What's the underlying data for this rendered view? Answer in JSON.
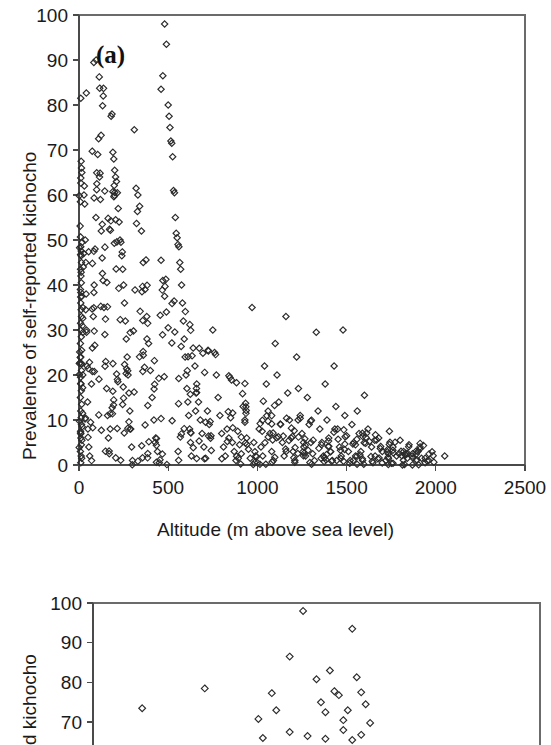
{
  "figure": {
    "caption_tags": [
      "(a)",
      "(b)"
    ],
    "marker_style": "open-diamond",
    "marker_color": "#2b2b2b",
    "axis_color": "#4a4a4a",
    "background": "#ffffff"
  },
  "panel_a": {
    "tag": "(a)",
    "xlabel": "Altitude (m above sea level)",
    "ylabel": "Prevalence of self-reported kichocho",
    "xticks": [
      "0",
      "500",
      "1000",
      "1500",
      "2000",
      "2500"
    ],
    "yticks": [
      "0",
      "10",
      "20",
      "30",
      "40",
      "50",
      "60",
      "70",
      "80",
      "90",
      "100"
    ]
  },
  "panel_b": {
    "tag": "(b)",
    "ylabel": "d kichocho",
    "yticks": [
      "70",
      "80",
      "90",
      "100"
    ]
  },
  "chart_data": [
    {
      "type": "scatter",
      "title": "(a)",
      "xlabel": "Altitude (m above sea level)",
      "ylabel": "Prevalence of self-reported kichocho",
      "xlim": [
        0,
        2500
      ],
      "ylim": [
        0,
        100
      ],
      "xticks": [
        0,
        500,
        1000,
        1500,
        2000,
        2500
      ],
      "yticks": [
        0,
        10,
        20,
        30,
        40,
        50,
        60,
        70,
        80,
        90,
        100
      ],
      "grid": false,
      "legend": "none",
      "marker": "open diamond",
      "n_points": 640,
      "description": "Strongly decreasing, wedge-shaped envelope: at low altitude (0-600 m) prevalence spans the full 0-100% range; above ~1600 m nearly all points fall below 15%, and beyond ~2050 m there is no data.",
      "points": [
        [
          10,
          81.5
        ],
        [
          12,
          67.5
        ],
        [
          14,
          66.0
        ],
        [
          16,
          65.0
        ],
        [
          8,
          58.5
        ],
        [
          18,
          49.5
        ],
        [
          10,
          48.5
        ],
        [
          12,
          46.5
        ],
        [
          14,
          45.0
        ],
        [
          9,
          43.5
        ],
        [
          11,
          42.0
        ],
        [
          13,
          40.5
        ],
        [
          8,
          39.0
        ],
        [
          15,
          37.5
        ],
        [
          10,
          36.0
        ],
        [
          12,
          34.5
        ],
        [
          14,
          33.0
        ],
        [
          9,
          31.5
        ],
        [
          11,
          30.0
        ],
        [
          13,
          28.5
        ],
        [
          8,
          27.0
        ],
        [
          15,
          25.5
        ],
        [
          10,
          24.0
        ],
        [
          12,
          22.5
        ],
        [
          14,
          21.0
        ],
        [
          9,
          19.5
        ],
        [
          11,
          18.0
        ],
        [
          13,
          16.5
        ],
        [
          8,
          15.0
        ],
        [
          15,
          13.5
        ],
        [
          10,
          12.0
        ],
        [
          12,
          10.5
        ],
        [
          14,
          9.0
        ],
        [
          9,
          7.5
        ],
        [
          11,
          6.0
        ],
        [
          13,
          4.5
        ],
        [
          8,
          3.0
        ],
        [
          15,
          1.5
        ],
        [
          10,
          0.5
        ],
        [
          12,
          2.0
        ],
        [
          16,
          5.5
        ],
        [
          18,
          8.5
        ],
        [
          20,
          11.5
        ],
        [
          22,
          35.0
        ],
        [
          24,
          44.0
        ],
        [
          26,
          47.0
        ],
        [
          28,
          60.0
        ],
        [
          30,
          62.0
        ],
        [
          32,
          58.0
        ],
        [
          35,
          50.0
        ],
        [
          38,
          45.0
        ],
        [
          40,
          38.0
        ],
        [
          42,
          30.0
        ],
        [
          45,
          22.0
        ],
        [
          48,
          14.0
        ],
        [
          50,
          8.0
        ],
        [
          55,
          4.0
        ],
        [
          60,
          2.0
        ],
        [
          65,
          9.5
        ],
        [
          70,
          18.0
        ],
        [
          75,
          26.0
        ],
        [
          80,
          33.0
        ],
        [
          85,
          40.0
        ],
        [
          90,
          48.0
        ],
        [
          95,
          55.0
        ],
        [
          100,
          62.5
        ],
        [
          105,
          69.0
        ],
        [
          110,
          72.5
        ],
        [
          115,
          64.0
        ],
        [
          120,
          59.0
        ],
        [
          125,
          52.0
        ],
        [
          130,
          46.0
        ],
        [
          135,
          41.0
        ],
        [
          140,
          35.0
        ],
        [
          145,
          29.0
        ],
        [
          150,
          23.0
        ],
        [
          155,
          17.0
        ],
        [
          160,
          11.0
        ],
        [
          165,
          6.0
        ],
        [
          170,
          2.5
        ],
        [
          175,
          8.0
        ],
        [
          180,
          77.5
        ],
        [
          185,
          78.0
        ],
        [
          190,
          69.5
        ],
        [
          195,
          68.0
        ],
        [
          200,
          65.5
        ],
        [
          205,
          64.0
        ],
        [
          210,
          63.0
        ],
        [
          215,
          60.5
        ],
        [
          220,
          57.0
        ],
        [
          225,
          54.0
        ],
        [
          230,
          50.0
        ],
        [
          235,
          49.5
        ],
        [
          240,
          46.5
        ],
        [
          245,
          43.5
        ],
        [
          250,
          40.0
        ],
        [
          255,
          36.0
        ],
        [
          260,
          32.0
        ],
        [
          265,
          28.0
        ],
        [
          270,
          24.0
        ],
        [
          275,
          20.0
        ],
        [
          280,
          16.0
        ],
        [
          285,
          12.0
        ],
        [
          290,
          8.0
        ],
        [
          295,
          4.0
        ],
        [
          300,
          1.0
        ],
        [
          310,
          74.5
        ],
        [
          320,
          61.5
        ],
        [
          330,
          60.0
        ],
        [
          340,
          57.5
        ],
        [
          350,
          52.0
        ],
        [
          360,
          45.0
        ],
        [
          370,
          39.0
        ],
        [
          380,
          33.0
        ],
        [
          390,
          27.0
        ],
        [
          400,
          21.0
        ],
        [
          410,
          15.0
        ],
        [
          420,
          10.0
        ],
        [
          430,
          6.0
        ],
        [
          440,
          3.0
        ],
        [
          450,
          0.5
        ],
        [
          460,
          45.5
        ],
        [
          470,
          41.0
        ],
        [
          480,
          37.5
        ],
        [
          490,
          34.0
        ],
        [
          500,
          30.5
        ],
        [
          460,
          83.5
        ],
        [
          470,
          86.5
        ],
        [
          480,
          98.0
        ],
        [
          490,
          93.5
        ],
        [
          500,
          80.0
        ],
        [
          505,
          77.5
        ],
        [
          510,
          75.0
        ],
        [
          515,
          72.0
        ],
        [
          520,
          71.5
        ],
        [
          525,
          68.5
        ],
        [
          530,
          61.0
        ],
        [
          535,
          60.5
        ],
        [
          540,
          55.0
        ],
        [
          545,
          51.5
        ],
        [
          550,
          50.5
        ],
        [
          555,
          49.0
        ],
        [
          560,
          48.5
        ],
        [
          565,
          45.0
        ],
        [
          570,
          43.5
        ],
        [
          575,
          40.0
        ],
        [
          580,
          36.0
        ],
        [
          585,
          32.0
        ],
        [
          590,
          28.0
        ],
        [
          595,
          24.0
        ],
        [
          600,
          20.0
        ],
        [
          605,
          17.0
        ],
        [
          610,
          14.0
        ],
        [
          615,
          11.0
        ],
        [
          620,
          8.0
        ],
        [
          625,
          5.0
        ],
        [
          630,
          2.0
        ],
        [
          640,
          26.0
        ],
        [
          650,
          22.0
        ],
        [
          660,
          18.0
        ],
        [
          670,
          14.0
        ],
        [
          680,
          10.0
        ],
        [
          690,
          7.0
        ],
        [
          700,
          4.0
        ],
        [
          710,
          1.5
        ],
        [
          720,
          12.0
        ],
        [
          730,
          9.0
        ],
        [
          740,
          6.5
        ],
        [
          750,
          30.0
        ],
        [
          760,
          25.0
        ],
        [
          770,
          20.0
        ],
        [
          780,
          15.0
        ],
        [
          790,
          11.0
        ],
        [
          800,
          7.0
        ],
        [
          810,
          4.0
        ],
        [
          820,
          2.0
        ],
        [
          830,
          8.0
        ],
        [
          840,
          6.0
        ],
        [
          850,
          10.5
        ],
        [
          860,
          5.0
        ],
        [
          870,
          3.0
        ],
        [
          880,
          1.0
        ],
        [
          890,
          7.5
        ],
        [
          900,
          4.5
        ],
        [
          910,
          2.5
        ],
        [
          920,
          13.0
        ],
        [
          930,
          9.5
        ],
        [
          940,
          6.0
        ],
        [
          950,
          3.5
        ],
        [
          960,
          1.5
        ],
        [
          970,
          35.0
        ],
        [
          980,
          5.0
        ],
        [
          990,
          2.0
        ],
        [
          1000,
          0.5
        ],
        [
          1010,
          8.0
        ],
        [
          1020,
          4.0
        ],
        [
          1030,
          2.0
        ],
        [
          1040,
          22.0
        ],
        [
          1050,
          18.0
        ],
        [
          1060,
          12.0
        ],
        [
          1070,
          7.0
        ],
        [
          1080,
          3.0
        ],
        [
          1090,
          1.0
        ],
        [
          1100,
          27.0
        ],
        [
          1110,
          20.0
        ],
        [
          1120,
          14.0
        ],
        [
          1130,
          9.0
        ],
        [
          1140,
          5.0
        ],
        [
          1150,
          2.0
        ],
        [
          1160,
          33.0
        ],
        [
          1170,
          16.0
        ],
        [
          1180,
          10.0
        ],
        [
          1190,
          6.0
        ],
        [
          1200,
          3.0
        ],
        [
          1210,
          1.0
        ],
        [
          1220,
          24.0
        ],
        [
          1230,
          17.0
        ],
        [
          1240,
          11.0
        ],
        [
          1250,
          7.0
        ],
        [
          1260,
          4.0
        ],
        [
          1270,
          2.0
        ],
        [
          1280,
          15.0
        ],
        [
          1290,
          9.0
        ],
        [
          1300,
          5.0
        ],
        [
          1310,
          2.5
        ],
        [
          1320,
          1.0
        ],
        [
          1330,
          29.5
        ],
        [
          1340,
          12.0
        ],
        [
          1350,
          8.0
        ],
        [
          1360,
          4.5
        ],
        [
          1370,
          2.0
        ],
        [
          1380,
          18.0
        ],
        [
          1390,
          10.0
        ],
        [
          1400,
          6.0
        ],
        [
          1410,
          3.0
        ],
        [
          1420,
          1.0
        ],
        [
          1430,
          22.0
        ],
        [
          1440,
          13.0
        ],
        [
          1450,
          8.0
        ],
        [
          1460,
          4.0
        ],
        [
          1470,
          2.0
        ],
        [
          1480,
          30.0
        ],
        [
          1490,
          11.0
        ],
        [
          1500,
          6.5
        ],
        [
          1510,
          3.0
        ],
        [
          1520,
          1.0
        ],
        [
          1530,
          9.0
        ],
        [
          1540,
          5.0
        ],
        [
          1550,
          2.0
        ],
        [
          1560,
          12.0
        ],
        [
          1570,
          7.0
        ],
        [
          1580,
          3.0
        ],
        [
          1590,
          1.0
        ],
        [
          1600,
          15.5
        ],
        [
          1620,
          8.0
        ],
        [
          1640,
          4.0
        ],
        [
          1660,
          2.0
        ],
        [
          1680,
          6.0
        ],
        [
          1700,
          3.0
        ],
        [
          1720,
          1.0
        ],
        [
          1740,
          7.5
        ],
        [
          1760,
          4.0
        ],
        [
          1780,
          2.0
        ],
        [
          1800,
          5.5
        ],
        [
          1820,
          3.0
        ],
        [
          1840,
          1.5
        ],
        [
          1850,
          4.5
        ],
        [
          1870,
          2.5
        ],
        [
          1890,
          1.0
        ],
        [
          1900,
          3.0
        ],
        [
          1920,
          1.5
        ],
        [
          1940,
          0.5
        ],
        [
          1960,
          1.0
        ],
        [
          2050,
          2.0
        ]
      ]
    },
    {
      "type": "scatter",
      "title": "(b)",
      "xlabel": "",
      "ylabel": "d kichocho",
      "ylim": [
        65,
        100
      ],
      "yticks": [
        70,
        80,
        90,
        100
      ],
      "grid": false,
      "legend": "none",
      "marker": "open diamond",
      "note": "Panel (b) is cropped at the bottom edge of the screenshot; only the 65-100 range of the y-axis is visible.",
      "points": [
        [
          0.11,
          73.5
        ],
        [
          0.25,
          78.5
        ],
        [
          0.37,
          70.8
        ],
        [
          0.4,
          77.3
        ],
        [
          0.41,
          73.0
        ],
        [
          0.44,
          86.5
        ],
        [
          0.47,
          98.0
        ],
        [
          0.5,
          80.8
        ],
        [
          0.51,
          75.0
        ],
        [
          0.52,
          72.5
        ],
        [
          0.53,
          83.0
        ],
        [
          0.54,
          77.8
        ],
        [
          0.55,
          76.8
        ],
        [
          0.56,
          70.5
        ],
        [
          0.57,
          73.0
        ],
        [
          0.58,
          93.5
        ],
        [
          0.59,
          81.3
        ],
        [
          0.6,
          77.5
        ],
        [
          0.61,
          74.5
        ],
        [
          0.62,
          69.8
        ],
        [
          0.44,
          67.5
        ],
        [
          0.48,
          66.5
        ],
        [
          0.56,
          68.0
        ],
        [
          0.6,
          66.8
        ],
        [
          0.38,
          66.0
        ],
        [
          0.52,
          65.8
        ],
        [
          0.58,
          65.5
        ]
      ]
    }
  ]
}
